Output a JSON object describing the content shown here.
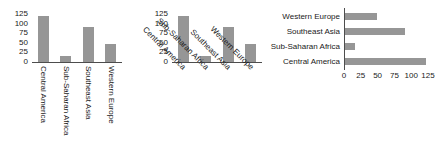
{
  "chart_data": [
    {
      "type": "bar",
      "orientation": "vertical",
      "title": "",
      "xlabel": "",
      "ylabel": "",
      "categories": [
        "Central America",
        "Sub-Saharan Africa",
        "Southeast Asia",
        "Western Europe"
      ],
      "values": [
        120,
        15,
        90,
        47
      ],
      "ytick_labels": [
        "125",
        "100",
        "75",
        "50",
        "25",
        "0"
      ],
      "ytick_values": [
        125,
        100,
        75,
        50,
        25,
        0
      ],
      "ylim": [
        0,
        125
      ],
      "grid": false,
      "legend": "none",
      "tick_label_rotation": 90,
      "bar_color": "#969696",
      "axis_color": "#4d4d4d"
    },
    {
      "type": "bar",
      "orientation": "vertical",
      "title": "",
      "xlabel": "",
      "ylabel": "",
      "categories": [
        "Central America",
        "Sub-Saharan Africa",
        "Southeast Asia",
        "Western Europe"
      ],
      "values": [
        120,
        15,
        90,
        47
      ],
      "ytick_labels": [
        "125",
        "100",
        "75",
        "50",
        "25",
        "0"
      ],
      "ytick_values": [
        125,
        100,
        75,
        50,
        25,
        0
      ],
      "ylim": [
        0,
        125
      ],
      "grid": false,
      "legend": "none",
      "tick_label_rotation": 45,
      "bar_color": "#969696",
      "axis_color": "#4d4d4d"
    },
    {
      "type": "bar",
      "orientation": "horizontal",
      "title": "",
      "xlabel": "",
      "ylabel": "",
      "categories": [
        "Western Europe",
        "Southeast Asia",
        "Sub-Saharan Africa",
        "Central America"
      ],
      "values": [
        47,
        90,
        15,
        120
      ],
      "xtick_labels": [
        "0",
        "25",
        "50",
        "75",
        "100",
        "125"
      ],
      "xtick_values": [
        0,
        25,
        50,
        75,
        100,
        125
      ],
      "xlim": [
        0,
        125
      ],
      "grid": false,
      "legend": "none",
      "tick_label_rotation": 0,
      "bar_color": "#969696",
      "axis_color": "#4d4d4d"
    }
  ],
  "panels": {
    "chart1": {
      "name": "vertical-bar-chart-rotated-90",
      "yticks": [
        "125",
        "100",
        "75",
        "50",
        "25",
        "0"
      ],
      "categories": [
        "Central America",
        "Sub-Saharan Africa",
        "Southeast Asia",
        "Western Europe"
      ]
    },
    "chart2": {
      "name": "vertical-bar-chart-rotated-45",
      "yticks": [
        "125",
        "100",
        "75",
        "50",
        "25",
        "0"
      ],
      "categories": [
        "Central America",
        "Sub-Saharan Africa",
        "Southeast Asia",
        "Western Europe"
      ]
    },
    "chart3": {
      "name": "horizontal-bar-chart",
      "xticks": [
        "0",
        "25",
        "50",
        "75",
        "100",
        "125"
      ],
      "categories": [
        "Western Europe",
        "Southeast Asia",
        "Sub-Saharan Africa",
        "Central America"
      ]
    }
  }
}
